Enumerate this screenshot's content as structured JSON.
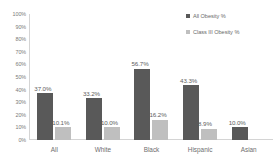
{
  "chart_data": {
    "type": "bar",
    "title": "",
    "subtitle": "",
    "xlabel": "",
    "ylabel": "",
    "categories": [
      "All",
      "White",
      "Black",
      "Hispanic",
      "Asian"
    ],
    "series": [
      {
        "name": "All Obesity %",
        "color": "#595959",
        "values": [
          37.0,
          33.2,
          56.7,
          43.3,
          10.0
        ],
        "labels": [
          "37.0%",
          "33.2%",
          "56.7%",
          "43.3%",
          "10.0%"
        ]
      },
      {
        "name": "Class III Obesity %",
        "color": "#bfbfbf",
        "values": [
          10.1,
          10.0,
          16.2,
          8.9,
          null
        ],
        "labels": [
          "10.1%",
          "10.0%",
          "16.2%",
          "8.9%",
          ""
        ]
      }
    ],
    "ylim": [
      0,
      100
    ],
    "ytick_values": [
      0,
      10,
      20,
      30,
      40,
      50,
      60,
      70,
      80,
      90,
      100
    ],
    "ytick_labels": [
      "0%",
      "10%",
      "20%",
      "30%",
      "40%",
      "50%",
      "60%",
      "70%",
      "80%",
      "90%",
      "100%"
    ],
    "grid": false,
    "legend_position": "top-right",
    "legend_entries": [
      "All Obesity %",
      "Class III Obesity %"
    ]
  }
}
